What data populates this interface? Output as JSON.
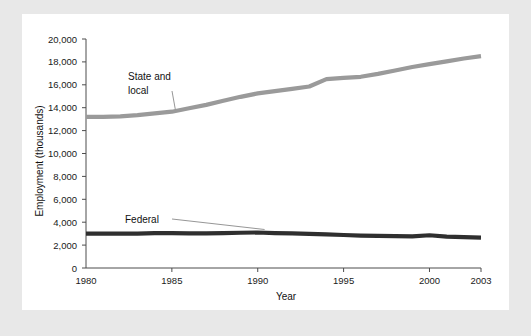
{
  "chart_data": {
    "type": "line",
    "title": "",
    "xlabel": "Year",
    "ylabel": "Employment (thousands)",
    "xlim": [
      1980,
      2003
    ],
    "ylim": [
      0,
      20000
    ],
    "xticks": [
      1980,
      1985,
      1990,
      1995,
      2000,
      2003
    ],
    "xtick_labels": [
      "1980",
      "1985",
      "1990",
      "1995",
      "2000",
      "2003"
    ],
    "yticks": [
      0,
      2000,
      4000,
      6000,
      8000,
      10000,
      12000,
      14000,
      16000,
      18000,
      20000
    ],
    "ytick_labels": [
      "0",
      "2,000",
      "4,000",
      "6,000",
      "8,000",
      "10,000",
      "12,000",
      "14,000",
      "16,000",
      "18,000",
      "20,000"
    ],
    "grid": false,
    "legend_position": "inline-annotations",
    "x": [
      1980,
      1981,
      1982,
      1983,
      1984,
      1985,
      1986,
      1987,
      1988,
      1989,
      1990,
      1991,
      1992,
      1993,
      1994,
      1995,
      1996,
      1997,
      1998,
      1999,
      2000,
      2001,
      2002,
      2003
    ],
    "series": [
      {
        "name": "State and local",
        "color": "#9a9a9a",
        "label_line1": "State and",
        "label_line2": "local",
        "values": [
          13200,
          13200,
          13250,
          13350,
          13500,
          13650,
          13950,
          14250,
          14600,
          14950,
          15250,
          15450,
          15650,
          15850,
          16500,
          16600,
          16700,
          16950,
          17250,
          17550,
          17800,
          18050,
          18300,
          18500
        ]
      },
      {
        "name": "Federal",
        "color": "#2f2f2f",
        "label_line1": "Federal",
        "label_line2": "",
        "values": [
          3000,
          3000,
          3000,
          3010,
          3050,
          3050,
          3030,
          3030,
          3050,
          3080,
          3100,
          3050,
          3020,
          2980,
          2930,
          2880,
          2830,
          2800,
          2780,
          2760,
          2860,
          2740,
          2700,
          2650
        ]
      }
    ]
  }
}
